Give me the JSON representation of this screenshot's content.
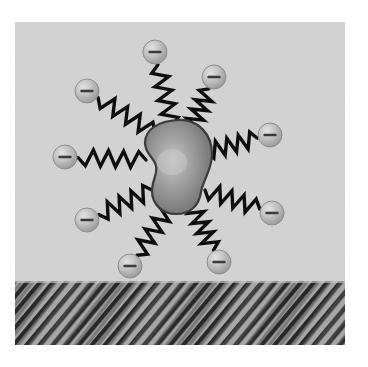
{
  "figure": {
    "type": "schematic-diagram",
    "canvas": {
      "width": 368,
      "height": 367,
      "background": "#ffffff"
    },
    "panel": {
      "x": 15,
      "y": 22,
      "width": 330,
      "height": 323,
      "background_color": "#d3d3d3",
      "label": "illustration panel"
    },
    "substrate": {
      "label": "substrate",
      "x": 15,
      "y": 281,
      "width": 330,
      "height": 64,
      "pattern": "diagonal-hatch",
      "base_color": "#a9a9a9",
      "stripe_color": "#2e2e2e",
      "stripe_angle_deg": 40,
      "stripe_period_px": 7
    },
    "core": {
      "label": "nanoparticle-core",
      "shape": "kidney-blob",
      "center_x": 178,
      "center_y": 166,
      "width": 68,
      "height": 92,
      "fill_light": "#b9b9b9",
      "fill_dark": "#6e6e6e",
      "stroke_color": "#3c3c3c",
      "highlight_x": 170,
      "highlight_y": 160
    },
    "ligands": {
      "label": "zigzag ligand chains",
      "count": 9,
      "stroke_color": "#111111",
      "stroke_width": 3.4,
      "zigzag_amplitude": 8,
      "zigzag_segments": 9
    },
    "charges": {
      "label": "negative charge beads",
      "symbol": "−",
      "symbol_name": "minus-sign",
      "count": 9,
      "radius": 12,
      "fill_light": "#d8d8d8",
      "fill_dark": "#9a9a9a",
      "stroke_color": "#8c8c8c",
      "sign_color": "#3a3a3a"
    },
    "nodes": [
      {
        "id": "charge-1",
        "name": "charge-bead-top",
        "cx": 155,
        "cy": 52,
        "anchor_x": 172,
        "anchor_y": 126,
        "sign": "−"
      },
      {
        "id": "charge-2",
        "name": "charge-bead-upper-right",
        "cx": 214,
        "cy": 77,
        "anchor_x": 190,
        "anchor_y": 131,
        "sign": "−"
      },
      {
        "id": "charge-3",
        "name": "charge-bead-right",
        "cx": 270,
        "cy": 135,
        "anchor_x": 206,
        "anchor_y": 152,
        "sign": "−"
      },
      {
        "id": "charge-4",
        "name": "charge-bead-lower-right",
        "cx": 272,
        "cy": 213,
        "anchor_x": 205,
        "anchor_y": 190,
        "sign": "−"
      },
      {
        "id": "charge-5",
        "name": "charge-bead-bottom-right",
        "cx": 219,
        "cy": 262,
        "anchor_x": 192,
        "anchor_y": 205,
        "sign": "−"
      },
      {
        "id": "charge-6",
        "name": "charge-bead-bottom",
        "cx": 130,
        "cy": 266,
        "anchor_x": 170,
        "anchor_y": 206,
        "sign": "−"
      },
      {
        "id": "charge-7",
        "name": "charge-bead-lower-left",
        "cx": 87,
        "cy": 220,
        "anchor_x": 152,
        "anchor_y": 190,
        "sign": "−"
      },
      {
        "id": "charge-8",
        "name": "charge-bead-left",
        "cx": 65,
        "cy": 157,
        "anchor_x": 146,
        "anchor_y": 160,
        "sign": "−"
      },
      {
        "id": "charge-9",
        "name": "charge-bead-upper-left",
        "cx": 87,
        "cy": 91,
        "anchor_x": 155,
        "anchor_y": 133,
        "sign": "−"
      }
    ]
  }
}
